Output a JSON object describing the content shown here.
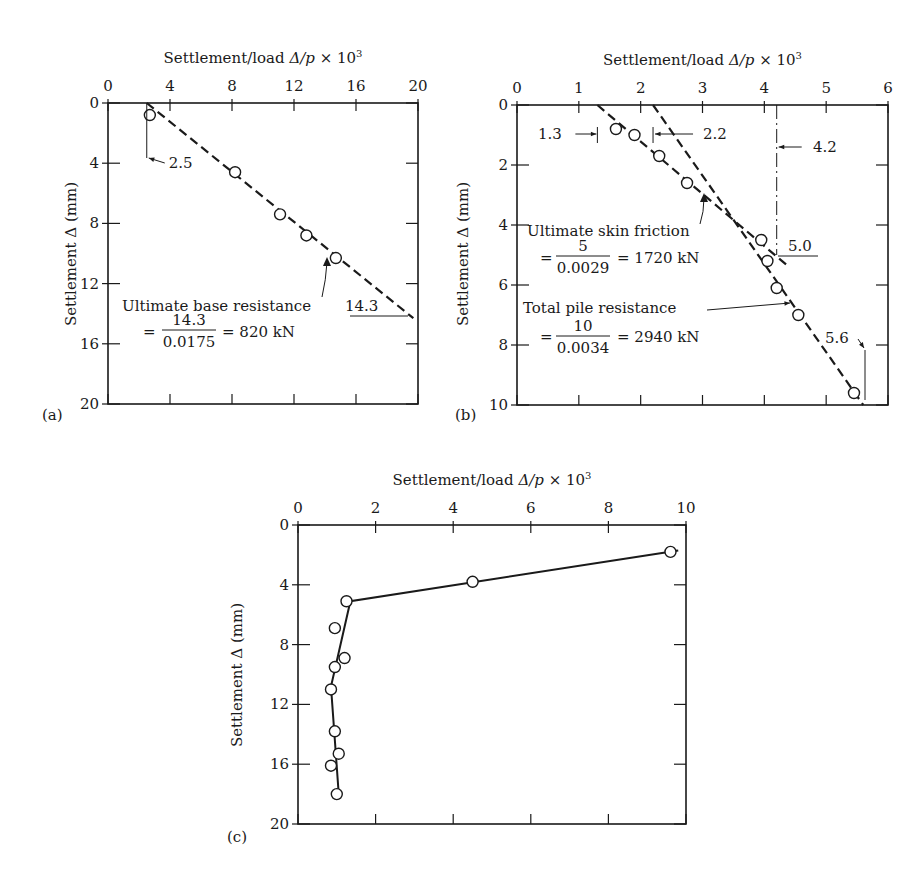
{
  "chart_data": [
    {
      "panel": "(a)",
      "type": "scatter",
      "title": "Settlement/load Δ/p × 10³",
      "xlabel": "Settlement/load Δ/p × 10³",
      "ylabel": "Settlement Δ (mm)",
      "xlim": [
        0,
        20
      ],
      "ylim": [
        0,
        20
      ],
      "y_inverted": true,
      "xticks": [
        0,
        4,
        8,
        12,
        16,
        20
      ],
      "yticks": [
        0,
        4,
        8,
        12,
        16,
        20
      ],
      "grid": false,
      "points": [
        {
          "x": 2.7,
          "y": 0.8
        },
        {
          "x": 8.2,
          "y": 4.6
        },
        {
          "x": 11.1,
          "y": 7.4
        },
        {
          "x": 12.8,
          "y": 8.8
        },
        {
          "x": 14.7,
          "y": 10.3
        }
      ],
      "lines": [
        {
          "style": "dashed",
          "from": {
            "x": 2.5,
            "y": 0
          },
          "to": {
            "x": 19.7,
            "y": 14.3
          }
        }
      ],
      "annotations": {
        "intercept": "2.5",
        "line1": "Ultimate base resistance",
        "value": "14.3",
        "eq_prefix": "=",
        "numerator": "14.3",
        "denominator": "0.0175",
        "result": "= 820 kN"
      }
    },
    {
      "panel": "(b)",
      "type": "scatter",
      "title": "Settlement/load Δ/p × 10³",
      "xlabel": "Settlement/load Δ/p × 10³",
      "ylabel": "Settlement Δ (mm)",
      "xlim": [
        0,
        6
      ],
      "ylim": [
        0,
        10
      ],
      "y_inverted": true,
      "xticks": [
        0,
        1,
        2,
        3,
        4,
        5,
        6
      ],
      "yticks": [
        0,
        2,
        4,
        6,
        8,
        10
      ],
      "grid": false,
      "points": [
        {
          "x": 1.6,
          "y": 0.8
        },
        {
          "x": 1.9,
          "y": 1.0
        },
        {
          "x": 2.3,
          "y": 1.7
        },
        {
          "x": 2.75,
          "y": 2.6
        },
        {
          "x": 3.95,
          "y": 4.5
        },
        {
          "x": 4.05,
          "y": 5.2
        },
        {
          "x": 4.2,
          "y": 6.1
        },
        {
          "x": 4.55,
          "y": 7.0
        },
        {
          "x": 5.45,
          "y": 9.6
        }
      ],
      "lines": [
        {
          "name": "skin friction",
          "style": "dashed",
          "from": {
            "x": 1.3,
            "y": 0
          },
          "to": {
            "x": 4.4,
            "y": 5.4
          }
        },
        {
          "name": "total",
          "style": "dashed",
          "from": {
            "x": 2.2,
            "y": 0
          },
          "to": {
            "x": 5.6,
            "y": 10
          }
        }
      ],
      "annotations": {
        "i1": "1.3",
        "i2": "2.2",
        "i3": "4.2",
        "v1": "5.0",
        "v2": "5.6",
        "skin_label": "Ultimate skin friction",
        "skin_num": "5",
        "skin_den": "0.0029",
        "skin_result": "= 1720 kN",
        "total_label": "Total pile resistance",
        "total_num": "10",
        "total_den": "0.0034",
        "total_result": "= 2940 kN",
        "eq_prefix": "="
      }
    },
    {
      "panel": "(c)",
      "type": "line",
      "title": "Settlement/load Δ/p × 10³",
      "xlabel": "Settlement/load Δ/p × 10³",
      "ylabel": "Settlement Δ (mm)",
      "xlim": [
        0,
        10
      ],
      "ylim": [
        0,
        20
      ],
      "y_inverted": true,
      "xticks": [
        0,
        2,
        4,
        6,
        8,
        10
      ],
      "yticks": [
        0,
        4,
        8,
        12,
        16,
        20
      ],
      "grid": false,
      "points": [
        {
          "x": 9.6,
          "y": 1.8
        },
        {
          "x": 4.5,
          "y": 3.8
        },
        {
          "x": 1.25,
          "y": 5.1
        },
        {
          "x": 0.95,
          "y": 6.9
        },
        {
          "x": 1.2,
          "y": 8.9
        },
        {
          "x": 0.95,
          "y": 9.5
        },
        {
          "x": 0.85,
          "y": 11.0
        },
        {
          "x": 0.95,
          "y": 13.8
        },
        {
          "x": 1.05,
          "y": 15.3
        },
        {
          "x": 0.85,
          "y": 16.1
        },
        {
          "x": 1.0,
          "y": 18.0
        }
      ],
      "fit_line": [
        {
          "x": 9.8,
          "y": 1.7
        },
        {
          "x": 1.35,
          "y": 5.1
        },
        {
          "x": 0.85,
          "y": 10.8
        },
        {
          "x": 1.05,
          "y": 18.0
        }
      ]
    }
  ],
  "labels": {
    "panel_a": "(a)",
    "panel_b": "(b)",
    "panel_c": "(c)",
    "x_title": "Settlement/load Δ/p × 10",
    "x_title_sup": "3",
    "y_title": "Settlement Δ (mm)"
  }
}
